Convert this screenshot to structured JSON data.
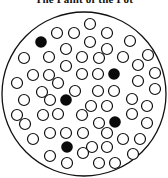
{
  "title": "The Paint of the Pot",
  "diagram": {
    "outer_circle": {
      "cx": 84,
      "cy": 94,
      "r": 82,
      "stroke": "#111111",
      "stroke_width": 1.3
    },
    "dot_radius": 5.5,
    "colors": {
      "open_stroke": "#111111",
      "open_fill": "#ffffff",
      "filled": "#0a0a0a"
    },
    "open_dots": [
      [
        90,
        24
      ],
      [
        57,
        33
      ],
      [
        74,
        33
      ],
      [
        107,
        33
      ],
      [
        90,
        42
      ],
      [
        130,
        41
      ],
      [
        66,
        49
      ],
      [
        107,
        49
      ],
      [
        24,
        58
      ],
      [
        49,
        57
      ],
      [
        82,
        57
      ],
      [
        99,
        58
      ],
      [
        123,
        57
      ],
      [
        148,
        55
      ],
      [
        66,
        66
      ],
      [
        138,
        65
      ],
      [
        33,
        75
      ],
      [
        49,
        75
      ],
      [
        82,
        74
      ],
      [
        98,
        74
      ],
      [
        155,
        73
      ],
      [
        17,
        83
      ],
      [
        58,
        83
      ],
      [
        138,
        81
      ],
      [
        42,
        92
      ],
      [
        75,
        91
      ],
      [
        98,
        91
      ],
      [
        114,
        91
      ],
      [
        155,
        89
      ],
      [
        24,
        100
      ],
      [
        50,
        100
      ],
      [
        132,
        99
      ],
      [
        91,
        106
      ],
      [
        107,
        106
      ],
      [
        147,
        106
      ],
      [
        17,
        115
      ],
      [
        43,
        115
      ],
      [
        58,
        114
      ],
      [
        82,
        115
      ],
      [
        132,
        114
      ],
      [
        25,
        124
      ],
      [
        99,
        123
      ],
      [
        147,
        123
      ],
      [
        50,
        133
      ],
      [
        66,
        133
      ],
      [
        83,
        133
      ],
      [
        107,
        133
      ],
      [
        33,
        139
      ],
      [
        123,
        139
      ],
      [
        140,
        139
      ],
      [
        92,
        147
      ],
      [
        107,
        147
      ],
      [
        50,
        156
      ],
      [
        83,
        153
      ],
      [
        133,
        154
      ],
      [
        67,
        163
      ],
      [
        99,
        163
      ],
      [
        115,
        163
      ]
    ],
    "filled_dots": [
      [
        41,
        42
      ],
      [
        114,
        74
      ],
      [
        66,
        100
      ],
      [
        115,
        122
      ],
      [
        67,
        147
      ]
    ]
  }
}
